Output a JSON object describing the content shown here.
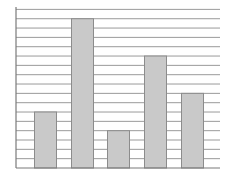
{
  "chart_data": {
    "type": "bar",
    "title": "",
    "xlabel": "",
    "ylabel": "",
    "categories": [
      "1",
      "2",
      "3",
      "4",
      "5"
    ],
    "values": [
      6,
      16,
      4,
      12,
      8
    ],
    "ylim": [
      0,
      17
    ],
    "grid": true,
    "grid_step": 1,
    "legend": null,
    "tick_labels_visible": false
  },
  "colors": {
    "bar_fill": "#c9c9c9",
    "bar_stroke": "#8c8c8c",
    "grid": "#9a9a9a",
    "axis": "#7a7a7a",
    "background": "#ffffff"
  },
  "layout": {
    "plot_left": 16,
    "plot_right": 220,
    "plot_top": 7,
    "baseline_y": 168,
    "unit_px": 9.33,
    "bar_x": [
      34,
      71,
      107,
      144,
      181
    ],
    "bar_width": 22
  }
}
